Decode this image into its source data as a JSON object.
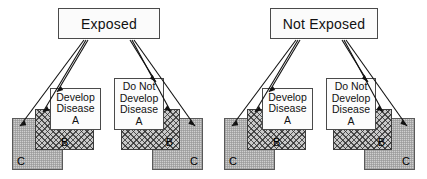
{
  "diagram": {
    "title_left": "Exposed",
    "title_right": "Not Exposed",
    "outcome_develop": {
      "line1": "Develop",
      "line2": "Disease",
      "line3": "A"
    },
    "outcome_not_develop": {
      "line1": "Do Not",
      "line2": "Develop",
      "line3": "Disease",
      "line4": "A"
    },
    "label_b": "B",
    "label_c": "C",
    "colors": {
      "box_fill": "#fbfbfb",
      "box_border": "#4a4a4a",
      "b_fill": "#c9c9c9",
      "c_fill": "#cfcfcf",
      "arrow": "#111111",
      "text": "#111111"
    },
    "groups": [
      {
        "id": "exposed-develop",
        "exposure": "Exposed",
        "outcome": "Develop Disease A",
        "side": "left",
        "factors": [
          "B",
          "C"
        ]
      },
      {
        "id": "exposed-not-develop",
        "exposure": "Exposed",
        "outcome": "Do Not Develop Disease A",
        "side": "right",
        "factors": [
          "B",
          "C"
        ]
      },
      {
        "id": "notexposed-develop",
        "exposure": "Not Exposed",
        "outcome": "Develop Disease A",
        "side": "left",
        "factors": [
          "B",
          "C"
        ]
      },
      {
        "id": "notexposed-not-develop",
        "exposure": "Not Exposed",
        "outcome": "Do Not Develop Disease A",
        "side": "right",
        "factors": [
          "B",
          "C"
        ]
      }
    ]
  }
}
